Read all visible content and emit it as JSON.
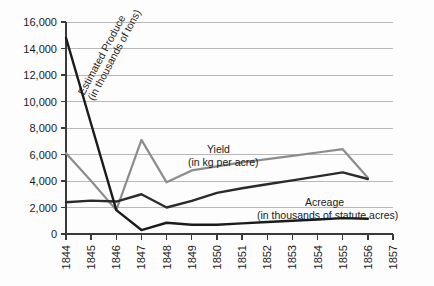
{
  "chart_data": {
    "type": "line",
    "title": "",
    "xlabel": "",
    "ylabel": "",
    "xlim": [
      1844,
      1857
    ],
    "ylim": [
      0,
      16000
    ],
    "grid": true,
    "legend_position": "inline-annotations",
    "x": [
      1844,
      1845,
      1846,
      1847,
      1848,
      1849,
      1850,
      1851,
      1852,
      1853,
      1854,
      1855,
      1856
    ],
    "categories": [
      "1844",
      "1845",
      "1846",
      "1847",
      "1848",
      "1849",
      "1850",
      "1851",
      "1852",
      "1853",
      "1854",
      "1855",
      "1856"
    ],
    "yticks": [
      0,
      2000,
      4000,
      6000,
      8000,
      10000,
      12000,
      14000,
      16000
    ],
    "ytick_labels": [
      "0",
      "2,000",
      "4,000",
      "6,000",
      "8,000",
      "10,000",
      "12,000",
      "14,000",
      "16,000"
    ],
    "xticks": [
      1844,
      1845,
      1846,
      1847,
      1848,
      1849,
      1850,
      1851,
      1852,
      1853,
      1854,
      1855,
      1856,
      1857
    ],
    "xtick_labels": [
      "1844",
      "1845",
      "1846",
      "1847",
      "1848",
      "1849",
      "1850",
      "1851",
      "1852",
      "1853",
      "1854",
      "1855",
      "1856",
      "1857"
    ],
    "series": [
      {
        "name": "Estimated Produce",
        "unit": "in thousands of tons",
        "label_line1": "Estimated Produce",
        "label_line2": "(in thousands of tons)",
        "color": "#1b1b1b",
        "width": 2.4,
        "values": [
          14800,
          8300,
          1800,
          300,
          850,
          700,
          700,
          800,
          900,
          1000,
          1100,
          1200,
          1150
        ]
      },
      {
        "name": "Yield",
        "unit": "in kg per acre",
        "label_line1": "Yield",
        "label_line2": "(in kg per acre)",
        "color": "#8c8c8c",
        "width": 2.2,
        "values": [
          6100,
          4000,
          1800,
          7100,
          3900,
          4800,
          5100,
          5400,
          5650,
          5900,
          6150,
          6400,
          4250
        ]
      },
      {
        "name": "Acreage",
        "unit": "in thousands of statute acres",
        "label_line1": "Acreage",
        "label_line2": "(in thousands of statute acres)",
        "color": "#2b2b2b",
        "width": 2.4,
        "values": [
          2400,
          2520,
          2450,
          3000,
          2000,
          2500,
          3100,
          3450,
          3750,
          4050,
          4350,
          4650,
          4150
        ]
      }
    ],
    "annotations": [
      {
        "text": "Estimated Produce",
        "sub": "(in thousands of tons)",
        "rotation": -62
      },
      {
        "text": "Yield",
        "sub": "(in kg per acre)",
        "rotation": 0
      },
      {
        "text": "Acreage",
        "sub": "(in thousands of statute acres)",
        "rotation": 0
      }
    ]
  },
  "colors": {
    "background": "#fdfdfd",
    "gridline": "#b9b9b9",
    "axis": "#3a3a3a",
    "text": "#1b1b1b",
    "produce": "#1b1b1b",
    "yield": "#8c8c8c",
    "acreage": "#2b2b2b"
  }
}
